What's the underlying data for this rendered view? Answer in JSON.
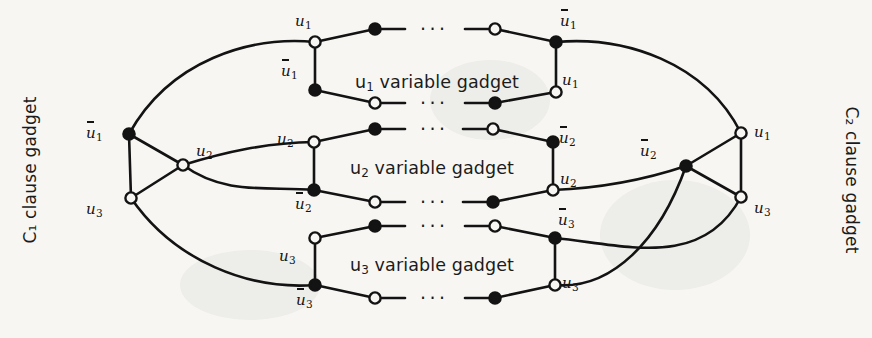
{
  "figure": {
    "width": 872,
    "height": 338,
    "background": "#f7f6f3",
    "ink": "#131313"
  },
  "clause_gadgets": {
    "left": {
      "caption": "C₁ clause gadget",
      "nodes": [
        {
          "label_text": "u",
          "sub": "1",
          "overline": true,
          "filled": true,
          "x": 129,
          "y": 134,
          "label_x": 86,
          "label_y": 124
        },
        {
          "label_text": "u",
          "sub": "2",
          "overline": false,
          "filled": false,
          "x": 183,
          "y": 165,
          "label_x": 196,
          "label_y": 142
        },
        {
          "label_text": "u",
          "sub": "3",
          "overline": false,
          "filled": false,
          "x": 131,
          "y": 198,
          "label_x": 86,
          "label_y": 200
        }
      ]
    },
    "right": {
      "caption": "C₂ clause gadget",
      "nodes": [
        {
          "label_text": "u",
          "sub": "1",
          "overline": false,
          "filled": false,
          "x": 741,
          "y": 133,
          "label_x": 754,
          "label_y": 123
        },
        {
          "label_text": "u",
          "sub": "2",
          "overline": true,
          "filled": true,
          "x": 686,
          "y": 166,
          "label_x": 640,
          "label_y": 142
        },
        {
          "label_text": "u",
          "sub": "3",
          "overline": false,
          "filled": false,
          "x": 741,
          "y": 197,
          "label_x": 754,
          "label_y": 199
        }
      ]
    }
  },
  "variable_gadgets": [
    {
      "id": "u1",
      "caption_var": "u",
      "caption_sub": "1",
      "caption_rest": " variable gadget",
      "caption_x": 355,
      "caption_y": 72,
      "top_row": {
        "left_node": {
          "x": 315,
          "y": 42,
          "filled": false,
          "label_text": "u",
          "sub": "1",
          "overline": false,
          "label_x": 295,
          "label_y": 12
        },
        "mid_left": {
          "x": 375,
          "y": 29,
          "filled": true
        },
        "mid_right": {
          "x": 495,
          "y": 29,
          "filled": false
        },
        "right_node": {
          "x": 556,
          "y": 42,
          "filled": true,
          "label_text": "u",
          "sub": "1",
          "overline": true,
          "label_x": 560,
          "label_y": 12
        },
        "ellipsis_x": 420,
        "ellipsis_y": 20
      },
      "bottom_row": {
        "left_node": {
          "x": 315,
          "y": 90,
          "filled": true,
          "label_text": "u",
          "sub": "1",
          "overline": true,
          "label_x": 281,
          "label_y": 62
        },
        "mid_left": {
          "x": 375,
          "y": 103,
          "filled": false
        },
        "mid_right": {
          "x": 495,
          "y": 103,
          "filled": true
        },
        "right_node": {
          "x": 556,
          "y": 92,
          "filled": false,
          "label_text": "u",
          "sub": "1",
          "overline": false,
          "label_x": 562,
          "label_y": 71
        },
        "ellipsis_x": 420,
        "ellipsis_y": 94
      }
    },
    {
      "id": "u2",
      "caption_var": "u",
      "caption_sub": "2",
      "caption_rest": " variable gadget",
      "caption_x": 350,
      "caption_y": 158,
      "top_row": {
        "left_node": {
          "x": 314,
          "y": 142,
          "filled": false,
          "label_text": "u",
          "sub": "2",
          "overline": false,
          "label_x": 277,
          "label_y": 130
        },
        "mid_left": {
          "x": 375,
          "y": 129,
          "filled": true
        },
        "mid_right": {
          "x": 493,
          "y": 129,
          "filled": false
        },
        "right_node": {
          "x": 553,
          "y": 142,
          "filled": true,
          "label_text": "u",
          "sub": "2",
          "overline": true,
          "label_x": 559,
          "label_y": 129
        },
        "ellipsis_x": 420,
        "ellipsis_y": 120
      },
      "bottom_row": {
        "left_node": {
          "x": 314,
          "y": 190,
          "filled": true,
          "label_text": "u",
          "sub": "2",
          "overline": true,
          "label_x": 295,
          "label_y": 195
        },
        "mid_left": {
          "x": 375,
          "y": 202,
          "filled": false
        },
        "mid_right": {
          "x": 493,
          "y": 202,
          "filled": true
        },
        "right_node": {
          "x": 553,
          "y": 190,
          "filled": false,
          "label_text": "u",
          "sub": "2",
          "overline": false,
          "label_x": 560,
          "label_y": 170
        },
        "ellipsis_x": 420,
        "ellipsis_y": 193
      }
    },
    {
      "id": "u3",
      "caption_var": "u",
      "caption_sub": "3",
      "caption_rest": " variable gadget",
      "caption_x": 350,
      "caption_y": 255,
      "top_row": {
        "left_node": {
          "x": 315,
          "y": 238,
          "filled": false,
          "label_text": "u",
          "sub": "3",
          "overline": false,
          "label_x": 279,
          "label_y": 247
        },
        "mid_left": {
          "x": 375,
          "y": 226,
          "filled": true
        },
        "mid_right": {
          "x": 495,
          "y": 226,
          "filled": false
        },
        "right_node": {
          "x": 555,
          "y": 238,
          "filled": true,
          "label_text": "u",
          "sub": "3",
          "overline": true,
          "label_x": 558,
          "label_y": 211
        },
        "ellipsis_x": 420,
        "ellipsis_y": 217
      },
      "bottom_row": {
        "left_node": {
          "x": 315,
          "y": 285,
          "filled": true,
          "label_text": "u",
          "sub": "3",
          "overline": true,
          "label_x": 296,
          "label_y": 291
        },
        "mid_left": {
          "x": 375,
          "y": 298,
          "filled": false
        },
        "mid_right": {
          "x": 495,
          "y": 298,
          "filled": true
        },
        "right_node": {
          "x": 555,
          "y": 285,
          "filled": false,
          "label_text": "u",
          "sub": "3",
          "overline": false,
          "label_x": 562,
          "label_y": 274
        },
        "ellipsis_x": 420,
        "ellipsis_y": 289
      }
    }
  ],
  "ellipsis_glyph": "···"
}
